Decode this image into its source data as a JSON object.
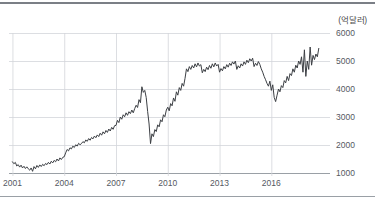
{
  "figure": {
    "unit_label": "(억달러)",
    "background_color": "#ffffff",
    "top_rule_color": "#7b7f86",
    "bottom_rule_color": "#9aa0a6"
  },
  "chart_data": {
    "type": "line",
    "title": "",
    "subtitle": "",
    "xlabel": "",
    "ylabel": "",
    "unit": "억달러",
    "xlim": [
      2000.8,
      2019.4
    ],
    "ylim": [
      700,
      6000
    ],
    "yticks": [
      1000,
      2000,
      3000,
      4000,
      5000,
      6000
    ],
    "ytick_labels": [
      "1000",
      "2000",
      "3000",
      "4000",
      "5000",
      "6000"
    ],
    "xticks": [
      2001,
      2004,
      2007,
      2010,
      2013,
      2016
    ],
    "xtick_labels": [
      "2001",
      "2004",
      "2007",
      "2010",
      "2013",
      "2016"
    ],
    "grid": true,
    "grid_color": "#d3d6da",
    "legend": null,
    "legend_position": "none",
    "line_color": "#3c3f44",
    "line_width": 1,
    "series": [
      {
        "name": "수출액",
        "x": [
          2001.0,
          2001.083,
          2001.167,
          2001.25,
          2001.333,
          2001.417,
          2001.5,
          2001.583,
          2001.667,
          2001.75,
          2001.833,
          2001.917,
          2002.0,
          2002.083,
          2002.167,
          2002.25,
          2002.333,
          2002.417,
          2002.5,
          2002.583,
          2002.667,
          2002.75,
          2002.833,
          2002.917,
          2003.0,
          2003.083,
          2003.167,
          2003.25,
          2003.333,
          2003.417,
          2003.5,
          2003.583,
          2003.667,
          2003.75,
          2003.833,
          2003.917,
          2004.0,
          2004.083,
          2004.167,
          2004.25,
          2004.333,
          2004.417,
          2004.5,
          2004.583,
          2004.667,
          2004.75,
          2004.833,
          2004.917,
          2005.0,
          2005.083,
          2005.167,
          2005.25,
          2005.333,
          2005.417,
          2005.5,
          2005.583,
          2005.667,
          2005.75,
          2005.833,
          2005.917,
          2006.0,
          2006.083,
          2006.167,
          2006.25,
          2006.333,
          2006.417,
          2006.5,
          2006.583,
          2006.667,
          2006.75,
          2006.833,
          2006.917,
          2007.0,
          2007.083,
          2007.167,
          2007.25,
          2007.333,
          2007.417,
          2007.5,
          2007.583,
          2007.667,
          2007.75,
          2007.833,
          2007.917,
          2008.0,
          2008.083,
          2008.167,
          2008.25,
          2008.333,
          2008.417,
          2008.5,
          2008.583,
          2008.667,
          2008.75,
          2008.833,
          2008.917,
          2009.0,
          2009.083,
          2009.167,
          2009.25,
          2009.333,
          2009.417,
          2009.5,
          2009.583,
          2009.667,
          2009.75,
          2009.833,
          2009.917,
          2010.0,
          2010.083,
          2010.167,
          2010.25,
          2010.333,
          2010.417,
          2010.5,
          2010.583,
          2010.667,
          2010.75,
          2010.833,
          2010.917,
          2011.0,
          2011.083,
          2011.167,
          2011.25,
          2011.333,
          2011.417,
          2011.5,
          2011.583,
          2011.667,
          2011.75,
          2011.833,
          2011.917,
          2012.0,
          2012.083,
          2012.167,
          2012.25,
          2012.333,
          2012.417,
          2012.5,
          2012.583,
          2012.667,
          2012.75,
          2012.833,
          2012.917,
          2013.0,
          2013.083,
          2013.167,
          2013.25,
          2013.333,
          2013.417,
          2013.5,
          2013.583,
          2013.667,
          2013.75,
          2013.833,
          2013.917,
          2014.0,
          2014.083,
          2014.167,
          2014.25,
          2014.333,
          2014.417,
          2014.5,
          2014.583,
          2014.667,
          2014.75,
          2014.833,
          2014.917,
          2015.0,
          2015.083,
          2015.167,
          2015.25,
          2015.333,
          2015.417,
          2015.5,
          2015.583,
          2015.667,
          2015.75,
          2015.833,
          2015.917,
          2016.0,
          2016.083,
          2016.167,
          2016.25,
          2016.333,
          2016.417,
          2016.5,
          2016.583,
          2016.667,
          2016.75,
          2016.833,
          2016.917,
          2017.0,
          2017.083,
          2017.167,
          2017.25,
          2017.333,
          2017.417,
          2017.5,
          2017.583,
          2017.667,
          2017.75,
          2017.833,
          2017.917,
          2018.0,
          2018.083,
          2018.167,
          2018.25,
          2018.333,
          2018.417,
          2018.5,
          2018.583,
          2018.667,
          2018.75
        ],
        "values": [
          1400,
          1330,
          1380,
          1250,
          1300,
          1210,
          1280,
          1180,
          1240,
          1160,
          1220,
          1150,
          1100,
          1180,
          1060,
          1230,
          1150,
          1270,
          1200,
          1290,
          1230,
          1310,
          1260,
          1340,
          1300,
          1380,
          1320,
          1420,
          1360,
          1450,
          1400,
          1500,
          1430,
          1540,
          1480,
          1560,
          1580,
          1720,
          1840,
          1790,
          1900,
          1860,
          1960,
          1910,
          2010,
          1960,
          2060,
          2010,
          2050,
          2120,
          2080,
          2180,
          2130,
          2230,
          2170,
          2270,
          2220,
          2320,
          2260,
          2360,
          2300,
          2420,
          2350,
          2470,
          2400,
          2520,
          2450,
          2570,
          2500,
          2630,
          2560,
          2690,
          2700,
          2880,
          2800,
          3000,
          2920,
          3080,
          3010,
          3150,
          3060,
          3190,
          3120,
          3250,
          3150,
          3300,
          3420,
          3340,
          3620,
          3510,
          4080,
          3880,
          3950,
          3700,
          3200,
          2750,
          2050,
          2400,
          2300,
          2550,
          2480,
          2720,
          2650,
          2900,
          2830,
          3080,
          3010,
          3250,
          3350,
          3220,
          3480,
          3400,
          3680,
          3560,
          3900,
          3780,
          4050,
          3950,
          4200,
          4100,
          4380,
          4720,
          4620,
          4800,
          4700,
          4840,
          4750,
          4900,
          4790,
          4930,
          4820,
          4870,
          4580,
          4700,
          4620,
          4780,
          4690,
          4840,
          4740,
          4900,
          4790,
          4930,
          4820,
          4880,
          4600,
          4730,
          4650,
          4800,
          4720,
          4870,
          4780,
          4920,
          4840,
          4970,
          4890,
          5000,
          4700,
          4830,
          4750,
          4900,
          4820,
          4970,
          4880,
          5030,
          4940,
          5080,
          5000,
          5100,
          4800,
          4920,
          4840,
          4980,
          4880,
          4720,
          4600,
          4450,
          4330,
          4200,
          4100,
          4280,
          3950,
          4150,
          3700,
          3550,
          3780,
          4000,
          3900,
          4120,
          4050,
          4300,
          4220,
          4450,
          4300,
          4550,
          4480,
          4720,
          4600,
          4850,
          4750,
          5000,
          4880,
          5150,
          4600,
          5400,
          4450,
          5000,
          4700,
          5500,
          4850,
          5200,
          5050,
          5250,
          5150,
          5450
        ]
      }
    ]
  }
}
